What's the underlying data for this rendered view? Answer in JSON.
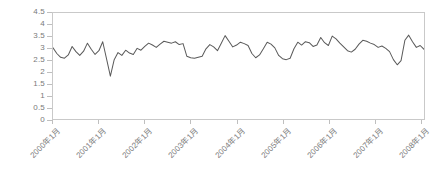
{
  "chart_data": {
    "type": "line",
    "title": "",
    "subtitle": "",
    "xlabel": "",
    "ylabel": "",
    "ylim": [
      0,
      4.5
    ],
    "grid": false,
    "legend": null,
    "legend_position": "none",
    "line_color": "#595959",
    "frame_color": "#c9c9c9",
    "tick_label_color": "#7a7a7a",
    "y_ticks": [
      "4.5",
      "4",
      "3.5",
      "3",
      "2.5",
      "2",
      "1.5",
      "1",
      "0.5",
      "0"
    ],
    "y_tick_values": [
      4.5,
      4,
      3.5,
      3,
      2.5,
      2,
      1.5,
      1,
      0.5,
      0
    ],
    "x_tick_labels": [
      "2000年1月",
      "2001年1月",
      "2002年1月",
      "2003年1月",
      "2004年1月",
      "2005年1月",
      "2006年1月",
      "2007年1月",
      "2008年1月"
    ],
    "x_tick_indices": [
      0,
      12,
      24,
      36,
      48,
      60,
      72,
      84,
      96
    ],
    "x_unit": "month",
    "x_start": "2000年1月",
    "x_end": "2008年1月",
    "n_points": 98,
    "series": [
      {
        "name": "series-1",
        "color": "#595959",
        "values": [
          3.02,
          2.78,
          2.62,
          2.58,
          2.72,
          3.08,
          2.86,
          2.7,
          2.88,
          3.22,
          2.96,
          2.74,
          2.9,
          3.28,
          2.55,
          1.82,
          2.52,
          2.82,
          2.7,
          2.92,
          2.8,
          2.74,
          3.0,
          2.92,
          3.08,
          3.22,
          3.14,
          3.04,
          3.18,
          3.3,
          3.26,
          3.22,
          3.28,
          3.16,
          3.2,
          2.66,
          2.6,
          2.58,
          2.62,
          2.66,
          2.98,
          3.16,
          3.06,
          2.9,
          3.22,
          3.54,
          3.3,
          3.06,
          3.14,
          3.26,
          3.2,
          3.12,
          2.78,
          2.6,
          2.72,
          2.98,
          3.26,
          3.18,
          3.02,
          2.7,
          2.56,
          2.52,
          2.58,
          2.98,
          3.26,
          3.14,
          3.28,
          3.24,
          3.08,
          3.14,
          3.46,
          3.24,
          3.12,
          3.52,
          3.4,
          3.22,
          3.06,
          2.9,
          2.84,
          2.96,
          3.18,
          3.34,
          3.3,
          3.22,
          3.16,
          3.04,
          3.1,
          3.0,
          2.86,
          2.52,
          2.3,
          2.48,
          3.34,
          3.56,
          3.28,
          3.04,
          3.12,
          2.96
        ]
      }
    ]
  }
}
